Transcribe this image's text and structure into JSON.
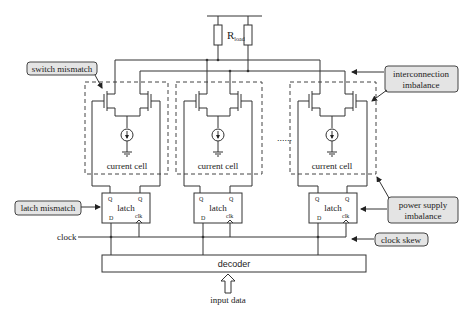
{
  "diagram": {
    "load_label_main": "R",
    "load_label_sub": "load",
    "cells": [
      {
        "cell_label": "current cell",
        "latch_label": "latch",
        "q": "Q",
        "qbar": "Q",
        "d": "D",
        "clk": "clk"
      },
      {
        "cell_label": "current cell",
        "latch_label": "latch",
        "q": "Q",
        "qbar": "Q",
        "d": "D",
        "clk": "clk"
      },
      {
        "cell_label": "current cell",
        "latch_label": "latch",
        "q": "Q",
        "qbar": "Q",
        "d": "D",
        "clk": "clk"
      }
    ],
    "ellipsis": "......",
    "clock_label": "clock",
    "decoder_label": "decoder",
    "input_label": "input data",
    "callouts": {
      "switch_mismatch": "switch mismatch",
      "interconnection_line1": "interconnection",
      "interconnection_line2": "imbalance",
      "latch_mismatch": "latch mismatch",
      "power_line1": "power supply",
      "power_line2": "imbalance",
      "clock_skew": "clock skew"
    },
    "colors": {
      "callout_fill": "#e4e4e4",
      "line": "#333333"
    }
  }
}
